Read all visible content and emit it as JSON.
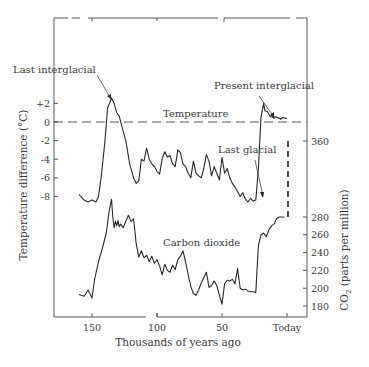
{
  "chart_data": {
    "type": "line",
    "title": "",
    "xlabel": "Thousands of years ago",
    "x_ticks": [
      "150",
      "100",
      "50",
      "Today"
    ],
    "x_tick_values": [
      150,
      100,
      50,
      0
    ],
    "xlim": [
      180,
      -15
    ],
    "grid": false,
    "legend": null,
    "axes": {
      "left": {
        "label": "Temperature difference (°C)",
        "ticks": [
          "+2",
          "0",
          "-2",
          "-4",
          "-6",
          "-8"
        ],
        "tick_values": [
          2,
          0,
          -2,
          -4,
          -6,
          -8
        ]
      },
      "right": {
        "label": "CO₂ (parts per million)",
        "ticks": [
          "360",
          "280",
          "260",
          "240",
          "220",
          "200",
          "180"
        ],
        "tick_values": [
          360,
          280,
          260,
          240,
          220,
          200,
          180
        ]
      }
    },
    "reference_line": {
      "name": "Temperature zero line",
      "y": 0,
      "style": "dashed"
    },
    "series": [
      {
        "name": "Temperature",
        "axis": "left",
        "x": [
          160,
          156,
          153,
          150,
          147,
          145,
          143,
          140,
          138,
          136,
          135,
          133,
          131,
          129,
          127,
          124,
          121,
          118,
          116,
          114,
          112,
          110,
          108,
          106,
          104,
          102,
          100,
          98,
          96,
          94,
          92,
          90,
          88,
          86,
          84,
          82,
          80,
          78,
          76,
          74,
          72,
          70,
          68,
          66,
          64,
          62,
          60,
          58,
          56,
          54,
          52,
          50,
          48,
          46,
          44,
          42,
          40,
          38,
          36,
          34,
          32,
          30,
          28,
          26,
          24,
          22,
          20,
          18,
          17,
          15,
          13,
          11,
          10,
          9,
          8,
          6,
          5,
          4,
          3,
          2,
          1,
          0
        ],
        "values": [
          -7.8,
          -8.4,
          -8.6,
          -8.4,
          -8.6,
          -8.0,
          -6.0,
          -2.0,
          1.5,
          2.2,
          2.6,
          2.0,
          1.0,
          0.6,
          -0.5,
          -2.0,
          -4.5,
          -6.0,
          -6.6,
          -6.3,
          -4.0,
          -4.2,
          -2.8,
          -4.0,
          -4.5,
          -4.8,
          -5.3,
          -5.6,
          -3.9,
          -3.2,
          -3.8,
          -3.6,
          -4.5,
          -4.8,
          -3.0,
          -3.3,
          -4.5,
          -4.8,
          -5.5,
          -6.0,
          -4.2,
          -5.5,
          -5.8,
          -6.0,
          -5.0,
          -3.5,
          -4.2,
          -5.8,
          -4.8,
          -5.5,
          -6.2,
          -3.8,
          -5.5,
          -5.0,
          -6.0,
          -6.6,
          -7.0,
          -7.5,
          -8.0,
          -7.6,
          -8.3,
          -8.6,
          -8.2,
          -8.5,
          -8.4,
          -5.0,
          0.5,
          2.0,
          1.2,
          1.1,
          0.6,
          0.5,
          0.4,
          0.6,
          0.5,
          0.4,
          0.3,
          0.4,
          0.5,
          0.4,
          0.4,
          0.4
        ]
      },
      {
        "name": "Carbon dioxide",
        "axis": "right",
        "x": [
          160,
          156,
          153,
          150,
          148,
          145,
          142,
          139,
          137,
          135,
          134,
          133,
          132,
          131,
          130,
          129,
          128,
          126,
          124,
          122,
          120,
          118,
          116,
          114,
          112,
          110,
          108,
          106,
          104,
          102,
          100,
          98,
          96,
          94,
          92,
          90,
          88,
          86,
          84,
          82,
          80,
          78,
          76,
          74,
          72,
          70,
          68,
          66,
          64,
          62,
          60,
          58,
          56,
          54,
          52,
          50,
          48,
          46,
          44,
          42,
          40,
          38,
          36,
          34,
          32,
          30,
          28,
          26,
          24,
          22,
          20,
          18,
          16,
          14,
          12,
          10,
          8,
          6,
          4,
          2
        ],
        "values": [
          193,
          191,
          198,
          189,
          210,
          230,
          245,
          262,
          285,
          300,
          280,
          268,
          275,
          270,
          276,
          269,
          272,
          268,
          275,
          282,
          275,
          278,
          250,
          235,
          242,
          234,
          237,
          230,
          236,
          228,
          232,
          225,
          215,
          227,
          220,
          218,
          226,
          221,
          232,
          236,
          242,
          229,
          215,
          202,
          194,
          192,
          198,
          206,
          212,
          218,
          201,
          203,
          208,
          203,
          192,
          182,
          205,
          209,
          208,
          210,
          205,
          222,
          200,
          198,
          199,
          197,
          196,
          196,
          195,
          248,
          260,
          262,
          258,
          265,
          270,
          272,
          278,
          280,
          280,
          280
        ]
      }
    ],
    "projection": {
      "name": "Projected CO₂ rise",
      "style": "dashed",
      "from_ppm": 280,
      "to_ppm": 360,
      "x": 1
    },
    "annotations": [
      {
        "text": "Last interglacial",
        "target_series": "Temperature",
        "target_x": 135
      },
      {
        "text": "Present interglacial",
        "target_series": "Temperature",
        "target_x": 13
      },
      {
        "text": "Last glacial",
        "target_series": "Temperature",
        "target_x": 22
      },
      {
        "text": "Temperature",
        "type": "series-label"
      },
      {
        "text": "Carbon dioxide",
        "type": "series-label"
      }
    ]
  },
  "labels": {
    "xlabel": "Thousands of years ago",
    "ylabel_left": "Temperature difference (°C)",
    "ylabel_right_pre": "CO",
    "ylabel_right_sub": "2",
    "ylabel_right_post": " (parts per million)",
    "temp_series": "Temperature",
    "co2_series": "Carbon dioxide",
    "annot_last_interglacial": "Last interglacial",
    "annot_present_interglacial": "Present interglacial",
    "annot_last_glacial": "Last glacial",
    "x_ticks": [
      "150",
      "100",
      "50",
      "Today"
    ],
    "temp_ticks": [
      "+2",
      "0",
      "-2",
      "-4",
      "-6",
      "-8"
    ],
    "co2_ticks": [
      "360",
      "280",
      "260",
      "240",
      "220",
      "200",
      "180"
    ]
  }
}
